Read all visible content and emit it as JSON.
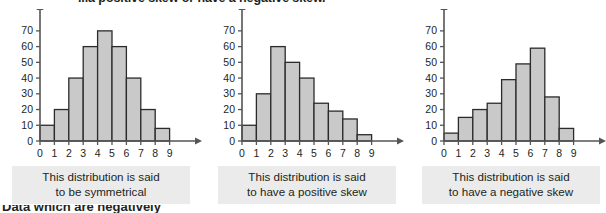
{
  "page": {
    "top_heading_partial": "...a positive skew or have a negative skew.",
    "bottom_heading_partial": "Data which are negatively"
  },
  "charts": [
    {
      "caption_line1": "This distribution is said",
      "caption_line2": "to be symmetrical",
      "chart_data": {
        "type": "bar",
        "title": "",
        "xlabel": "",
        "ylabel": "",
        "categories": [
          "0",
          "1",
          "2",
          "3",
          "4",
          "5",
          "6",
          "7",
          "8",
          "9"
        ],
        "values": [
          10,
          20,
          40,
          60,
          70,
          60,
          40,
          20,
          8
        ],
        "ylim": [
          0,
          75
        ],
        "yticks": [
          0,
          10,
          20,
          30,
          40,
          50,
          60,
          70
        ],
        "xticks": [
          0,
          1,
          2,
          3,
          4,
          5,
          6,
          7,
          8,
          9
        ],
        "grid": false,
        "legend": false,
        "bar_fill": "#c9c9c9",
        "bar_stroke": "#2b2b2b"
      }
    },
    {
      "caption_line1": "This distribution is said",
      "caption_line2": "to have a positive skew",
      "chart_data": {
        "type": "bar",
        "title": "",
        "xlabel": "",
        "ylabel": "",
        "categories": [
          "0",
          "1",
          "2",
          "3",
          "4",
          "5",
          "6",
          "7",
          "8",
          "9"
        ],
        "values": [
          10,
          30,
          60,
          50,
          40,
          24,
          19,
          14,
          4
        ],
        "ylim": [
          0,
          75
        ],
        "yticks": [
          0,
          10,
          20,
          30,
          40,
          50,
          60,
          70
        ],
        "xticks": [
          0,
          1,
          2,
          3,
          4,
          5,
          6,
          7,
          8,
          9
        ],
        "grid": false,
        "legend": false,
        "bar_fill": "#c9c9c9",
        "bar_stroke": "#2b2b2b"
      }
    },
    {
      "caption_line1": "This distribution is said",
      "caption_line2": "to have a negative skew",
      "chart_data": {
        "type": "bar",
        "title": "",
        "xlabel": "",
        "ylabel": "",
        "categories": [
          "0",
          "1",
          "2",
          "3",
          "4",
          "5",
          "6",
          "7",
          "8",
          "9"
        ],
        "values": [
          5,
          15,
          20,
          24,
          39,
          49,
          59,
          28,
          8
        ],
        "ylim": [
          0,
          75
        ],
        "yticks": [
          0,
          10,
          20,
          30,
          40,
          50,
          60,
          70
        ],
        "xticks": [
          0,
          1,
          2,
          3,
          4,
          5,
          6,
          7,
          8,
          9
        ],
        "grid": false,
        "legend": false,
        "bar_fill": "#c9c9c9",
        "bar_stroke": "#2b2b2b"
      }
    }
  ]
}
